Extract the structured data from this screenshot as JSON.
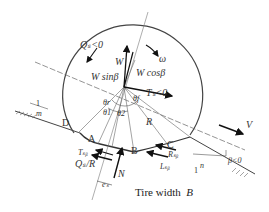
{
  "diagram": {
    "caption_text": "Tire width",
    "caption_symbol": "B",
    "labels": {
      "Qs": "Qₛ<0",
      "omega": "ω",
      "W": "W",
      "Wsin": "W sinβ",
      "Wcos": "W cosβ",
      "Ts": "Tₛ<0",
      "V": "V",
      "R": "R",
      "D": "D",
      "A": "A",
      "B": "B",
      "C": "C",
      "Tsb": "Tₛᵦ",
      "QsR": "Qₛ/R",
      "N": "N",
      "es": "eₛ",
      "Rsb": "Rₛᵦ",
      "Lsb": "Lₛᵦ",
      "beta": "β<0",
      "theta_f": "θf",
      "theta_r": "θr",
      "theta_1": "θ1",
      "theta_2": "θ2",
      "one_left": "1",
      "m_left": "m",
      "one_right": "1",
      "n_right": "n"
    },
    "colors": {
      "line": "#333333",
      "arrow": "#111111",
      "background": "#ffffff"
    }
  }
}
